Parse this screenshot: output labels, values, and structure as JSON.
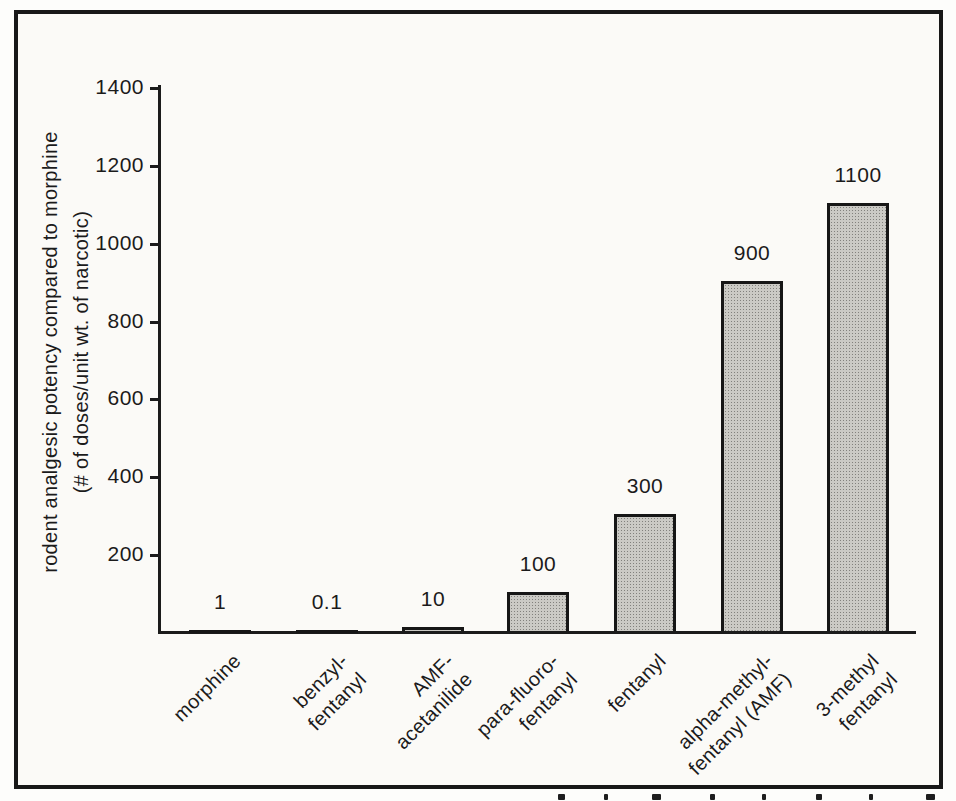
{
  "figure": {
    "frame_color": "#181818",
    "paper_color": "#fbfaf7",
    "ink_color": "#1b1b1b"
  },
  "chart_data": {
    "type": "bar",
    "title": "",
    "ylabel_line1": "rodent analgesic potency compared to morphine",
    "ylabel_line2": "(# of doses/unit wt. of narcotic)",
    "xlabel": "",
    "ylim": [
      0,
      1400
    ],
    "yticks": [
      200,
      400,
      600,
      800,
      1000,
      1200,
      1400
    ],
    "grid": false,
    "legend": false,
    "bar_fill": "#cbcac5",
    "bar_border": "#161616",
    "categories": [
      "morphine",
      "benzyl-fentanyl",
      "AMF-acetanilide",
      "para-fluoro-fentanyl",
      "fentanyl",
      "alpha-methyl-fentanyl (AMF)",
      "3-methyl fentanyl"
    ],
    "category_label_lines": [
      [
        "morphine"
      ],
      [
        "benzyl-",
        "fentanyl"
      ],
      [
        "AMF-",
        "acetanilide"
      ],
      [
        "para-fluoro-",
        "fentanyl"
      ],
      [
        "fentanyl"
      ],
      [
        "alpha-methyl-",
        "fentanyl (AMF)"
      ],
      [
        "3-methyl",
        "fentanyl"
      ]
    ],
    "values": [
      1,
      0.1,
      10,
      100,
      300,
      900,
      1100
    ],
    "value_labels": [
      "1",
      "0.1",
      "10",
      "100",
      "300",
      "900",
      "1100"
    ]
  }
}
